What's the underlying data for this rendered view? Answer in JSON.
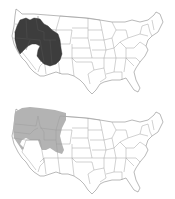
{
  "figure": {
    "panels": [
      {
        "id": "top",
        "region_label": "Range A",
        "fill_color": "#3d3d3d",
        "states_shaded": [
          "Oregon (east)",
          "Idaho (south)",
          "Nevada (north/east)",
          "Utah",
          "Wyoming (west/south)",
          "Colorado (west)",
          "Montana (southwest)",
          "California (northeast)"
        ]
      },
      {
        "id": "bottom",
        "region_label": "Range B",
        "fill_color": "#b3b3b3",
        "states_shaded": [
          "Washington",
          "Oregon",
          "Idaho",
          "Montana",
          "Wyoming (north)",
          "California (northeast)",
          "Nevada (northwest)"
        ]
      }
    ],
    "base_map": {
      "stroke_color": "#9a9a9a",
      "background": "#ffffff"
    }
  }
}
